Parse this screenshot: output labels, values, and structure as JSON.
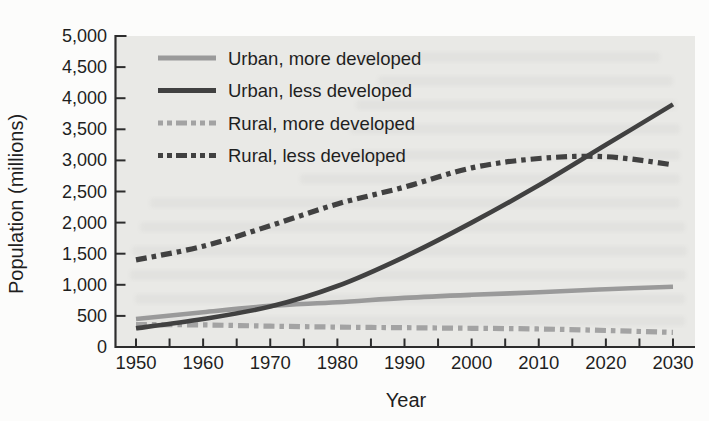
{
  "figure": {
    "background": "#fcfcfb",
    "plot_background": "#e9e9e6",
    "axis_color": "#2d2d2d",
    "text_color": "#1f1f1f"
  },
  "chart_data": {
    "type": "line",
    "title": "",
    "xlabel": "Year",
    "ylabel": "Population (millions)",
    "x": [
      1950,
      1960,
      1970,
      1980,
      1990,
      2000,
      2010,
      2020,
      2030
    ],
    "x_tick_labels": [
      "1950",
      "1960",
      "1970",
      "1980",
      "1990",
      "2000",
      "2010",
      "2020",
      "2030"
    ],
    "x_minor_tick_step": 5,
    "xlim": [
      1947,
      2033
    ],
    "ylim": [
      0,
      5000
    ],
    "y_ticks": [
      0,
      500,
      1000,
      1500,
      2000,
      2500,
      3000,
      3500,
      4000,
      4500,
      5000
    ],
    "y_tick_labels": [
      "0",
      "500",
      "1,000",
      "1,500",
      "2,000",
      "2,500",
      "3,000",
      "3,500",
      "4,000",
      "4,500",
      "5,000"
    ],
    "grid": false,
    "legend_position": "top-left",
    "series": [
      {
        "name": "Urban, more developed",
        "color": "#9a9a9a",
        "line_style": "solid",
        "values": [
          450,
          560,
          660,
          720,
          790,
          840,
          880,
          930,
          970
        ]
      },
      {
        "name": "Urban, less developed",
        "color": "#414141",
        "line_style": "solid",
        "values": [
          300,
          450,
          650,
          980,
          1450,
          2000,
          2600,
          3250,
          3900
        ]
      },
      {
        "name": "Rural, more developed",
        "color": "#a3a3a3",
        "line_style": "dashed",
        "values": [
          360,
          355,
          335,
          320,
          310,
          300,
          290,
          265,
          235
        ]
      },
      {
        "name": "Rural, less developed",
        "color": "#414141",
        "line_style": "dashed",
        "values": [
          1400,
          1620,
          1950,
          2300,
          2570,
          2880,
          3030,
          3060,
          2930
        ]
      }
    ]
  }
}
